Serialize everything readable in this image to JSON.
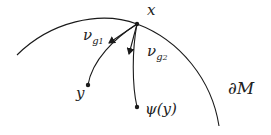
{
  "diagram": {
    "labels": {
      "x": "x",
      "y": "y",
      "psi_y": "ψ(y)",
      "nu": "ν",
      "g1_sub": "g",
      "g1_index": "1",
      "g2_sub": "g",
      "g2_index": "2",
      "boundary": "∂M"
    },
    "colors": {
      "stroke": "#1a1a1a",
      "background": "#ffffff"
    }
  }
}
